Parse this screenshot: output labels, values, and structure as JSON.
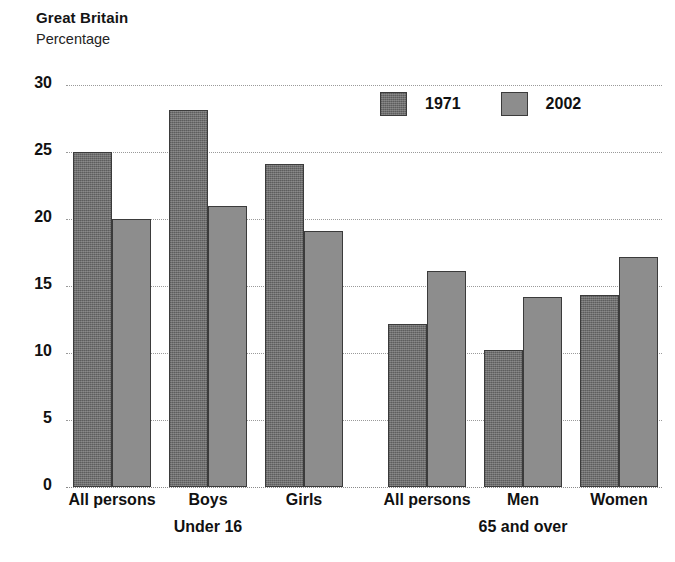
{
  "header": {
    "region_title": "Great Britain",
    "units_label": "Percentage"
  },
  "legend": {
    "items": [
      {
        "label": "1971",
        "color": "#6f6f6f",
        "key": "s1971"
      },
      {
        "label": "2002",
        "color": "#8d8d8d",
        "key": "s2002"
      }
    ]
  },
  "axis": {
    "y_ticks": [
      "30",
      "25",
      "20",
      "15",
      "10",
      "5",
      "0"
    ]
  },
  "groups": [
    {
      "label": "Under 16"
    },
    {
      "label": "65 and over"
    }
  ],
  "chart_data": {
    "type": "bar",
    "title": "Great Britain",
    "subtitle": "Percentage",
    "xlabel": "",
    "ylabel": "Percentage",
    "ylim": [
      0,
      30
    ],
    "ytick_step": 5,
    "grid": true,
    "legend_position": "top-right",
    "group_labels": [
      "Under 16",
      "65 and over"
    ],
    "categories": [
      "All persons",
      "Boys",
      "Girls",
      "All persons",
      "Men",
      "Women"
    ],
    "category_groups": [
      "Under 16",
      "Under 16",
      "Under 16",
      "65 and over",
      "65 and over",
      "65 and over"
    ],
    "series": [
      {
        "name": "1971",
        "color": "#6f6f6f",
        "values": [
          25.0,
          28.1,
          24.1,
          12.2,
          10.2,
          14.3
        ]
      },
      {
        "name": "2002",
        "color": "#8d8d8d",
        "values": [
          20.0,
          21.0,
          19.1,
          16.1,
          14.2,
          17.2
        ]
      }
    ]
  }
}
